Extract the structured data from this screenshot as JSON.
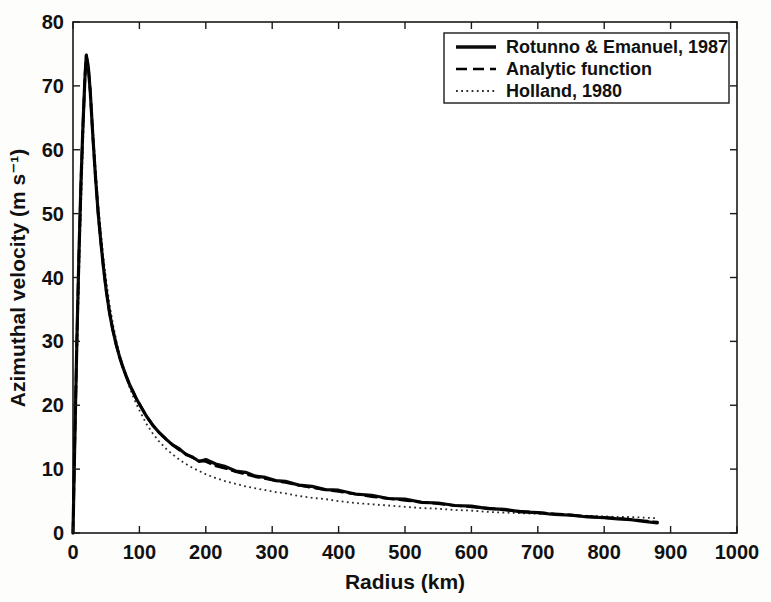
{
  "figure": {
    "background": "#fdfdfc",
    "plot_background": "#ffffff",
    "axis_color": "#1a1a1a"
  },
  "chart_data": {
    "type": "line",
    "title": "",
    "xlabel": "Radius (km)",
    "ylabel": "Azimuthal velocity (m s⁻¹)",
    "xlim": [
      0,
      1000
    ],
    "ylim": [
      0,
      80
    ],
    "x_ticks": [
      0,
      100,
      200,
      300,
      400,
      500,
      600,
      700,
      800,
      900,
      1000
    ],
    "y_ticks": [
      0,
      10,
      20,
      30,
      40,
      50,
      60,
      70,
      80
    ],
    "grid": false,
    "legend_position": "top-right",
    "series": [
      {
        "name": "Rotunno & Emanuel, 1987",
        "style": "solid",
        "color": "#0a0a0a",
        "x": [
          0,
          3,
          6,
          9,
          12,
          15,
          18,
          20,
          23,
          26,
          30,
          34,
          38,
          42,
          46,
          50,
          55,
          60,
          65,
          70,
          75,
          80,
          85,
          90,
          95,
          100,
          110,
          120,
          130,
          140,
          150,
          160,
          170,
          180,
          190,
          200,
          215,
          230,
          245,
          260,
          275,
          290,
          305,
          320,
          340,
          360,
          380,
          400,
          425,
          450,
          475,
          500,
          525,
          550,
          575,
          600,
          625,
          650,
          675,
          700,
          725,
          750,
          775,
          800,
          820,
          840,
          860,
          880
        ],
        "v": [
          0,
          16,
          31,
          44,
          55,
          64,
          71.5,
          74.8,
          73,
          69,
          62,
          55.5,
          50,
          45.5,
          41.5,
          38,
          34.5,
          31.8,
          29.5,
          27.6,
          26,
          24.6,
          23.3,
          22.2,
          21.1,
          20.2,
          18.4,
          16.9,
          15.7,
          14.7,
          13.8,
          13.2,
          12.3,
          11.9,
          11.2,
          11.5,
          10.8,
          10.4,
          9.7,
          9.5,
          8.9,
          8.7,
          8.2,
          8.1,
          7.5,
          7.3,
          6.8,
          6.7,
          6.1,
          5.9,
          5.4,
          5.3,
          4.8,
          4.7,
          4.3,
          4.2,
          3.8,
          3.7,
          3.3,
          3.2,
          2.9,
          2.8,
          2.5,
          2.4,
          2.2,
          2.1,
          1.8,
          1.6
        ]
      },
      {
        "name": "Analytic function",
        "style": "dashed",
        "color": "#000000",
        "x": [
          0,
          3,
          6,
          9,
          12,
          15,
          18,
          20,
          23,
          26,
          30,
          34,
          38,
          42,
          46,
          50,
          55,
          60,
          65,
          70,
          75,
          80,
          85,
          90,
          95,
          100,
          110,
          120,
          130,
          140,
          150,
          160,
          170,
          180,
          190,
          200,
          215,
          230,
          245,
          260,
          275,
          290,
          305,
          320,
          340,
          360,
          380,
          400,
          425,
          450,
          475,
          500,
          525,
          550,
          575,
          600,
          625,
          650,
          675,
          700,
          725,
          750,
          775,
          800,
          820,
          840,
          860,
          880
        ],
        "v": [
          0,
          16,
          31,
          44,
          55,
          64,
          71.5,
          74.8,
          73,
          69,
          62,
          55.5,
          50,
          45.5,
          41.5,
          38,
          34.5,
          31.8,
          29.5,
          27.6,
          26,
          24.6,
          23.3,
          22.2,
          21.1,
          20.2,
          18.4,
          16.9,
          15.7,
          14.7,
          13.8,
          13.0,
          12.4,
          11.8,
          11.3,
          11.2,
          10.5,
          10.1,
          9.6,
          9.2,
          8.8,
          8.5,
          8.2,
          7.9,
          7.5,
          7.1,
          6.8,
          6.5,
          6.1,
          5.7,
          5.4,
          5.1,
          4.8,
          4.6,
          4.3,
          4.1,
          3.9,
          3.6,
          3.4,
          3.2,
          3.0,
          2.8,
          2.6,
          2.4,
          2.3,
          2.1,
          1.9,
          1.7
        ]
      },
      {
        "name": "Holland, 1980",
        "style": "dotted",
        "color": "#2d2d2d",
        "x": [
          0,
          3,
          6,
          9,
          12,
          15,
          18,
          20,
          23,
          26,
          30,
          34,
          38,
          42,
          46,
          50,
          55,
          60,
          65,
          70,
          75,
          80,
          85,
          90,
          95,
          100,
          110,
          120,
          130,
          140,
          150,
          160,
          170,
          180,
          190,
          200,
          215,
          230,
          245,
          260,
          275,
          290,
          305,
          320,
          340,
          360,
          380,
          400,
          425,
          450,
          475,
          500,
          525,
          550,
          575,
          600,
          625,
          650,
          675,
          700,
          725,
          750,
          775,
          800,
          820,
          840,
          860,
          880
        ],
        "v": [
          0,
          13,
          27,
          40,
          51,
          61,
          70,
          74.3,
          73.2,
          70,
          63.5,
          57,
          51.5,
          47,
          43,
          39.5,
          35.8,
          32.8,
          30.2,
          28.0,
          26.1,
          24.4,
          22.9,
          21.5,
          20.3,
          19.2,
          17.2,
          15.6,
          14.3,
          13.2,
          12.3,
          11.5,
          10.8,
          10.2,
          9.7,
          9.2,
          8.6,
          8.1,
          7.7,
          7.3,
          7.0,
          6.7,
          6.4,
          6.2,
          5.8,
          5.5,
          5.3,
          5.0,
          4.7,
          4.5,
          4.3,
          4.1,
          3.9,
          3.8,
          3.6,
          3.5,
          3.3,
          3.2,
          3.1,
          3.0,
          2.9,
          2.8,
          2.7,
          2.6,
          2.5,
          2.5,
          2.4,
          2.3
        ]
      }
    ]
  }
}
